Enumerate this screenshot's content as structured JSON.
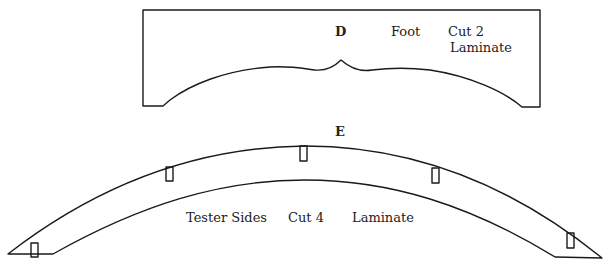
{
  "pieces": [
    {
      "id": "D",
      "name": "Foot",
      "cut": "Cut 2",
      "material": "Laminate"
    },
    {
      "id": "E",
      "name": "Tester Sides",
      "cut": "Cut 4",
      "material": "Laminate"
    }
  ],
  "colors": {
    "stroke": "#1a1a1a",
    "text": "#222222",
    "background": "#ffffff"
  }
}
